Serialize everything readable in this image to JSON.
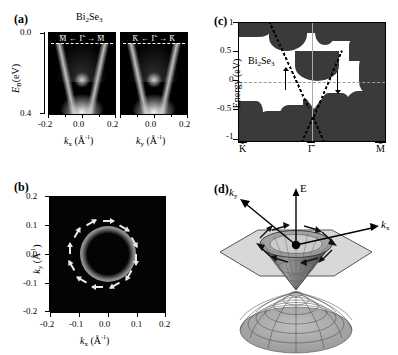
{
  "figure": {
    "material": "Bi",
    "material_sub1": "2",
    "material_mid": "Se",
    "material_sub2": "3"
  },
  "panel_a": {
    "label": "(a)",
    "title_main": "Bi",
    "title_sub1": "2",
    "title_mid": "Se",
    "title_sub2": "3",
    "ylabel_main": "E",
    "ylabel_sub": "B",
    "ylabel_unit": "(eV)",
    "yticks": [
      "0.0",
      "0.4"
    ],
    "left_top_label": "M̄ ← Γ̄ → M̄",
    "right_top_label": "K̄ ← Γ̄ → K̄",
    "left_xlabel_main": "k",
    "left_xlabel_sub": "x",
    "left_xlabel_unit": "(Å",
    "left_xlabel_sup": "-1",
    "left_xlabel_close": ")",
    "right_xlabel_main": "k",
    "right_xlabel_sub": "y",
    "xticks_left": [
      "-0.2",
      "0.0",
      "0.2"
    ],
    "xticks_right": [
      "0.0",
      "0.2"
    ],
    "energy_range_eV": [
      0.0,
      0.4
    ],
    "k_range_inv_A": [
      -0.2,
      0.2
    ],
    "fermi_level_eV": 0.0
  },
  "panel_b": {
    "label": "(b)",
    "xlabel_main": "k",
    "xlabel_sub": "x",
    "xlabel_unit": "(Å",
    "xlabel_sup": "-1",
    "xlabel_close": ")",
    "ylabel_main": "k",
    "ylabel_sub": "y",
    "xticks": [
      "-0.2",
      "-0.1",
      "0.0",
      "0.1",
      "0.2"
    ],
    "yticks": [
      "0.2",
      "0.1",
      "0.0",
      "-0.1",
      "-0.2"
    ],
    "fermi_ring_radius_inv_A": 0.09,
    "n_spin_arrows": 12,
    "spin_chirality": "counterclockwise",
    "arrow_color": "#e8e8e8",
    "background_color": "#040404"
  },
  "panel_c": {
    "label": "(c)",
    "material": "Bi",
    "material_sub1": "2",
    "material_mid": "Se",
    "material_sub2": "3",
    "ylabel": "Energy (eV)",
    "yticks": [
      "1",
      "0.5",
      "0",
      "-0.5",
      "-1"
    ],
    "xticks": [
      "K̄",
      "Γ̄",
      "M̄"
    ],
    "energy_range_eV": [
      -1,
      1
    ],
    "dirac_point_eV": -0.32,
    "spin_up_arrow": "↑",
    "spin_down_arrow": "↓"
  },
  "panel_d": {
    "label": "(d)",
    "axis_ky_main": "k",
    "axis_ky_sub": "y",
    "axis_kx_main": "k",
    "axis_kx_sub": "x",
    "axis_E": "E",
    "n_spin_arrows": 8,
    "spin_chirality": "counterclockwise",
    "cone_color": "#6d6d6d",
    "bz_plane_color": "#c9c9c9"
  },
  "chart_data": {
    "type": "scatter",
    "panels": [
      {
        "id": "a",
        "type": "heatmap",
        "title": "ARPES band dispersion",
        "xlabel": "k (Å^-1)",
        "ylabel": "E_B (eV)",
        "xlim": [
          -0.2,
          0.2
        ],
        "ylim": [
          0.4,
          0.0
        ],
        "subplots": [
          "M-Gamma-M (k_x)",
          "K-Gamma-K (k_y)"
        ],
        "features": [
          "Dirac cone V-shape",
          "bulk valence band",
          "Fermi level dashed line"
        ]
      },
      {
        "id": "b",
        "type": "heatmap",
        "title": "Fermi surface map",
        "xlabel": "k_x (Å^-1)",
        "ylabel": "k_y (Å^-1)",
        "xlim": [
          -0.2,
          0.2
        ],
        "ylim": [
          -0.2,
          0.2
        ],
        "ring_radius": 0.09,
        "spin_arrows": 12
      },
      {
        "id": "c",
        "type": "line",
        "title": "Calculated band structure",
        "xlabel": "",
        "ylabel": "Energy (eV)",
        "ylim": [
          -1,
          1
        ],
        "x_ticklabels": [
          "K̄",
          "Γ̄",
          "M̄"
        ],
        "y_ticks": [
          -1,
          -0.5,
          0,
          0.5,
          1
        ],
        "dirac_point": -0.32,
        "series": [
          {
            "name": "surface state left branch",
            "x": [
              0.23,
              0.5
            ],
            "y": [
              1.0,
              -0.32
            ]
          },
          {
            "name": "surface state right branch",
            "x": [
              0.5,
              0.72
            ],
            "y": [
              -0.32,
              0.55
            ]
          }
        ]
      },
      {
        "id": "d",
        "type": "scatter",
        "title": "Schematic Dirac cone with spin texture",
        "xlabel": "k_x",
        "ylabel": "k_y",
        "zlabel": "E",
        "spin_arrows": 8
      }
    ]
  }
}
